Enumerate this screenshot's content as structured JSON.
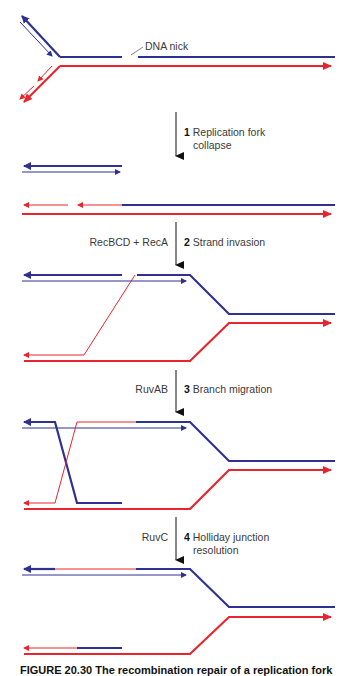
{
  "colors": {
    "blue": "#2e3192",
    "red": "#e8252e",
    "arrow": "#111111",
    "text": "#3a3a3a"
  },
  "annotations": {
    "nick_label": "DNA nick"
  },
  "steps": [
    {
      "number": "1",
      "title": "Replication fork",
      "title_line2": "collapse",
      "enzyme": ""
    },
    {
      "number": "2",
      "title": "Strand invasion",
      "title_line2": "",
      "enzyme": "RecBCD + RecA"
    },
    {
      "number": "3",
      "title": "Branch migration",
      "title_line2": "",
      "enzyme": "RuvAB"
    },
    {
      "number": "4",
      "title": "Holliday junction",
      "title_line2": "resolution",
      "enzyme": "RuvC"
    }
  ],
  "caption": "FIGURE 20.30  The recombination repair of a replication fork"
}
